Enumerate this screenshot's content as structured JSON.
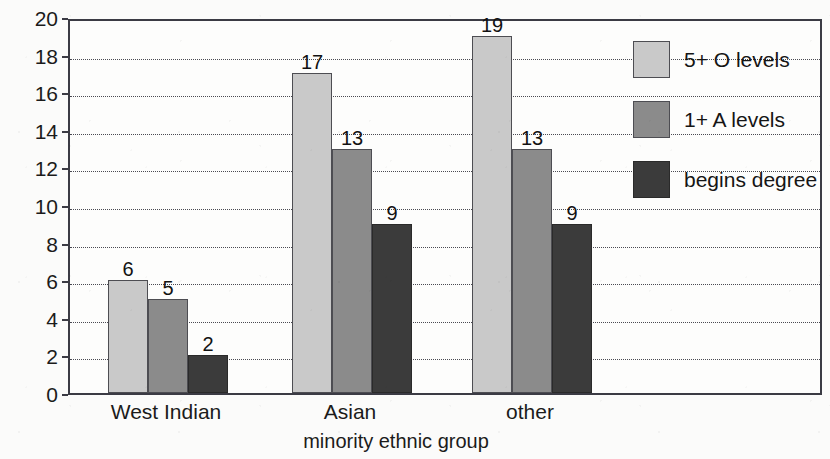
{
  "chart_data": {
    "type": "bar",
    "title": "",
    "xlabel": "minority ethnic group",
    "ylabel": "percentage of group",
    "categories": [
      "West Indian",
      "Asian",
      "other"
    ],
    "series": [
      {
        "name": "5+ O levels",
        "values": [
          6,
          17,
          19
        ],
        "color": "#c9c9c9"
      },
      {
        "name": "1+ A levels",
        "values": [
          5,
          13,
          13
        ],
        "color": "#8b8b8b"
      },
      {
        "name": "begins degree",
        "values": [
          2,
          9,
          9
        ],
        "color": "#3b3b3b"
      }
    ],
    "ylim": [
      0,
      20
    ],
    "yticks": [
      0,
      2,
      4,
      6,
      8,
      10,
      12,
      14,
      16,
      18,
      20
    ],
    "ytick_labels": [
      "0",
      "2",
      "4",
      "6",
      "8",
      "10",
      "12",
      "14",
      "16",
      "18",
      "20"
    ],
    "grid": true,
    "grid_style": "dotted",
    "legend_position": "upper-right-inside",
    "data_labels": true
  },
  "legend": {
    "entries": [
      {
        "label": "5+ O levels"
      },
      {
        "label": "1+ A levels"
      },
      {
        "label": "begins degree"
      }
    ]
  },
  "axis": {
    "y_title": "percentage of group",
    "x_title": "minority ethnic group"
  }
}
